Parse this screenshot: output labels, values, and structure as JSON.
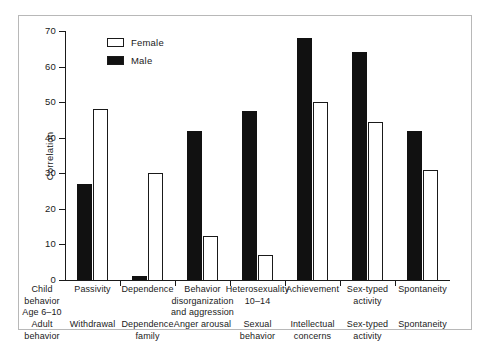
{
  "figure": {
    "border_color": "#b8b8b8"
  },
  "legend": {
    "items": [
      {
        "label": "Female",
        "style": "open",
        "swatch_fill": "#ffffff"
      },
      {
        "label": "Male",
        "style": "filled",
        "swatch_fill": "#111111"
      }
    ]
  },
  "axis": {
    "y_title": "Correlation",
    "y_ticks": [
      "0",
      "10",
      "20",
      "30",
      "40",
      "50",
      "60",
      "70"
    ]
  },
  "row_titles": {
    "child": "Child\nbehavior\nAge 6–10",
    "child_line1": "Child",
    "child_line2": "behavior",
    "child_line3": "Age 6–10",
    "adult_line1": "Adult",
    "adult_line2": "behavior"
  },
  "categories_child": [
    "Passivity",
    "Dependence",
    "Behavior\ndisorganization\nand aggression",
    "Heterosexuality\n10–14",
    "Achievement",
    "Sex-typed\nactivity",
    "Spontaneity"
  ],
  "categories_adult": [
    "Withdrawal",
    "Dependence\nfamily",
    "Anger arousal",
    "Sexual\nbehavior",
    "Intellectual\nconcerns",
    "Sex-typed\nactivity",
    "Spontaneity"
  ],
  "chart_data": {
    "type": "bar",
    "title": "",
    "subtitle": "",
    "xlabel": "",
    "ylabel": "Correlation",
    "ylim": [
      0,
      70
    ],
    "y_ticks": [
      0,
      10,
      20,
      30,
      40,
      50,
      60,
      70
    ],
    "grid": false,
    "legend_position": "top-left inside plot",
    "categories": [
      "Passivity",
      "Dependence",
      "Behavior disorganization and aggression",
      "Heterosexuality 10-14",
      "Achievement",
      "Sex-typed activity",
      "Spontaneity"
    ],
    "categories_adult_behavior": [
      "Withdrawal",
      "Dependence family",
      "Anger arousal",
      "Sexual behavior",
      "Intellectual concerns",
      "Sex-typed activity",
      "Spontaneity"
    ],
    "series": [
      {
        "name": "Male",
        "color": "#111111",
        "values": [
          27,
          1,
          42,
          47.5,
          68,
          64,
          42
        ]
      },
      {
        "name": "Female",
        "color": "#ffffff",
        "values": [
          48,
          30,
          12.5,
          7,
          50,
          44.5,
          31
        ]
      }
    ]
  }
}
